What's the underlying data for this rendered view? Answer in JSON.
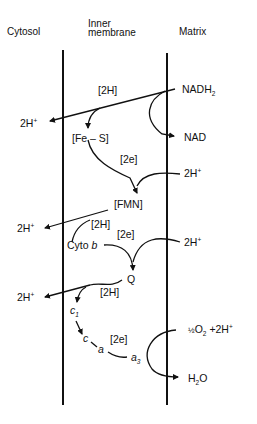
{
  "headers": {
    "cytosol": "Cytosol",
    "inner_line1": "Inner",
    "inner_line2": "membrane",
    "matrix": "Matrix"
  },
  "labels": {
    "nadh_main": "NADH",
    "nadh_sub": "2",
    "nad": "NAD",
    "h2_top": "[2H]",
    "h_out_1": "2H",
    "h_out_1_sup": "+",
    "fes": "[Fe – S]",
    "e2_1": "[2e]",
    "h_in_1": "2H",
    "h_in_1_sup": "+",
    "fmn": "[FMN]",
    "h_out_2": "2H",
    "h_out_2_sup": "+",
    "h2_mid": "[2H]",
    "e2_2": "[2e]",
    "cyto_b_prefix": "Cyto ",
    "cyto_b_italic": "b",
    "h_in_2": "2H",
    "h_in_2_sup": "+",
    "q": "Q",
    "h_out_3": "2H",
    "h_out_3_sup": "+",
    "h2_low": "[2H]",
    "c1_main": "c",
    "c1_sub": "1",
    "c": "c",
    "a": "a",
    "e2_3": "[2e]",
    "a3_main": "a",
    "a3_sub": "3",
    "o2_frac": "½",
    "o2_main": "O",
    "o2_sub": "2",
    "o2_plus": " +2H",
    "o2_sup": "+",
    "h2o_h": "H",
    "h2o_sub": "2",
    "h2o_o": "O"
  },
  "colors": {
    "ink": "#111111",
    "background": "#ffffff"
  }
}
